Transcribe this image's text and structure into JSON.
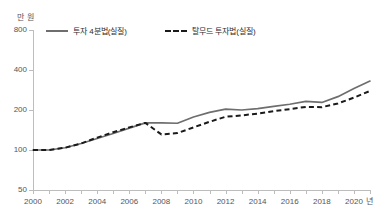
{
  "chart_data": {
    "type": "line",
    "title": "",
    "xlabel": "년",
    "ylabel": "만 원",
    "yscale": "log",
    "ylim": [
      50,
      800
    ],
    "xlim": [
      2000,
      2021
    ],
    "grid": false,
    "legend_position": "top",
    "ytick_labels": [
      "800",
      "400",
      "200",
      "100",
      "50"
    ],
    "ytick_values": [
      800,
      400,
      200,
      100,
      50
    ],
    "xtick_labels": [
      "2000",
      "2002",
      "2004",
      "2006",
      "2008",
      "2010",
      "2012",
      "2014",
      "2016",
      "2018",
      "2020"
    ],
    "xtick_values": [
      2000,
      2002,
      2004,
      2006,
      2008,
      2010,
      2012,
      2014,
      2016,
      2018,
      2020
    ],
    "x": [
      2000,
      2001,
      2002,
      2003,
      2004,
      2005,
      2006,
      2007,
      2008,
      2009,
      2010,
      2011,
      2012,
      2013,
      2014,
      2015,
      2016,
      2017,
      2018,
      2019,
      2020,
      2021
    ],
    "series": [
      {
        "name": "투자 4분법(실질)",
        "style": "solid",
        "color": "#6e6e6e",
        "values": [
          100,
          100,
          104,
          112,
          122,
          133,
          146,
          160,
          160,
          159,
          177,
          192,
          203,
          200,
          205,
          213,
          221,
          232,
          228,
          252,
          290,
          330
        ]
      },
      {
        "name": "탈무드 투자법(실질)",
        "style": "dashed",
        "color": "#1a1a1a",
        "values": [
          100,
          100,
          104,
          112,
          124,
          136,
          148,
          160,
          131,
          134,
          148,
          163,
          178,
          182,
          188,
          196,
          203,
          211,
          210,
          224,
          248,
          278
        ]
      }
    ]
  },
  "axis": {
    "unit_label": "만 원",
    "x_unit_label": "년"
  },
  "legend": {
    "entries": [
      {
        "label": "투자 4분법(실질)"
      },
      {
        "label": "탈무드 투자법(실질)"
      }
    ]
  }
}
